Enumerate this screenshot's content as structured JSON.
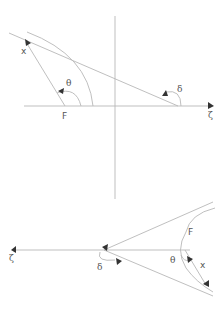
{
  "diagram": {
    "top": {
      "labels": {
        "x": "x",
        "F": "F",
        "theta": "θ",
        "delta": "δ",
        "zeta": "ζ"
      }
    },
    "bottom": {
      "labels": {
        "x": "x",
        "F": "F",
        "theta": "θ",
        "delta": "δ",
        "zeta": "ζ"
      }
    },
    "colors": {
      "line": "#b8b8b8",
      "arrow": "#333333",
      "text": "#555555"
    }
  }
}
